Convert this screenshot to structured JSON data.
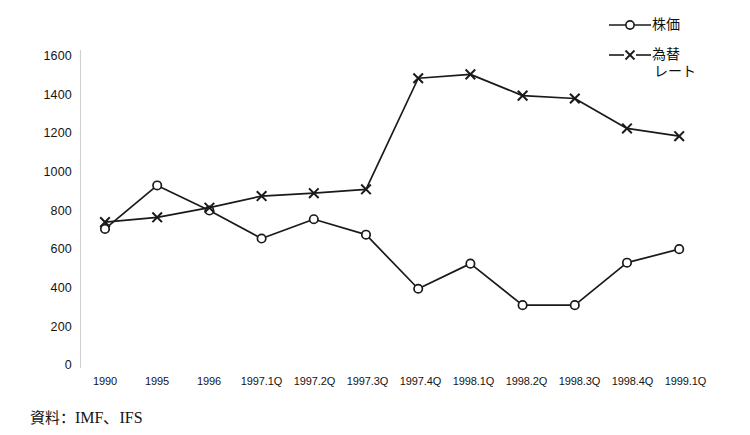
{
  "chart_data": {
    "type": "line",
    "title": "",
    "xlabel": "",
    "ylabel": "",
    "ylim": [
      0,
      1600
    ],
    "yticks": [
      0,
      200,
      400,
      600,
      800,
      1000,
      1200,
      1400,
      1600
    ],
    "ytick_labels": [
      "0",
      "200",
      "400",
      "600",
      "800",
      "1000",
      "1200",
      "1400",
      "1600"
    ],
    "grid": false,
    "legend_position": "top-right",
    "categories": [
      "1990",
      "1995",
      "1996",
      "1997.1Q",
      "1997.2Q",
      "1997.3Q",
      "1997.4Q",
      "1998.1Q",
      "1998.2Q",
      "1998.3Q",
      "1998.4Q",
      "1999.1Q"
    ],
    "series": [
      {
        "name": "株価",
        "marker": "circle",
        "color": "#1a1a1a",
        "values": [
          710,
          935,
          805,
          660,
          760,
          680,
          400,
          530,
          315,
          315,
          535,
          605
        ]
      },
      {
        "name": "為替レート",
        "marker": "x",
        "color": "#1a1a1a",
        "values": [
          745,
          770,
          820,
          880,
          895,
          915,
          1490,
          1510,
          1400,
          1385,
          1230,
          1190
        ]
      }
    ]
  },
  "legend": {
    "items": [
      {
        "label": "株価",
        "label_line2": "",
        "marker": "circle"
      },
      {
        "label": "為替",
        "label_line2": "レート",
        "marker": "x"
      }
    ]
  },
  "footer": {
    "source_label": "資料：",
    "source_value": "IMF、IFS"
  },
  "colors": {
    "line": "#1a1a1a",
    "axis": "#c8c8c8",
    "background": "#ffffff",
    "text": "#141414"
  }
}
